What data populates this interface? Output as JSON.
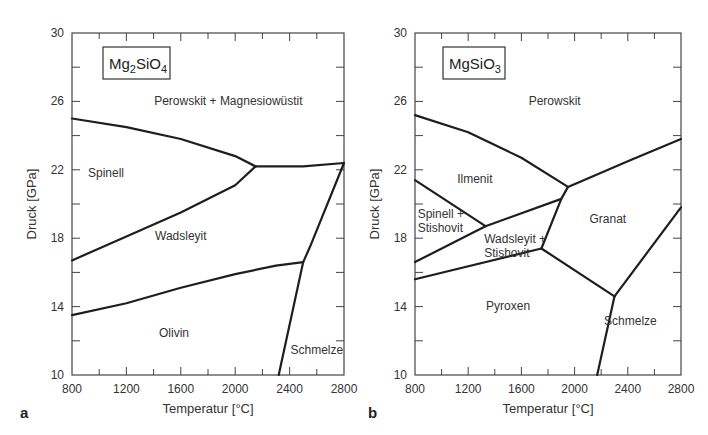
{
  "chart_data": [
    {
      "panel": "a",
      "type": "line",
      "title": "Mg2SiO4",
      "title_parts": {
        "base": "Mg",
        "sub1": "2",
        "mid": "SiO",
        "sub2": "4"
      },
      "xlabel": "Temperatur [°C]",
      "ylabel": "Druck [GPa]",
      "xlim": [
        800,
        2800
      ],
      "ylim": [
        10,
        30
      ],
      "xticks": [
        800,
        1200,
        1600,
        2000,
        2400,
        2800
      ],
      "yticks": [
        10,
        14,
        18,
        22,
        26,
        30
      ],
      "grid": false,
      "regions": [
        {
          "label": "Perowskit + Magnesiowüstit",
          "x": 1950,
          "y": 25.8
        },
        {
          "label": "Spinell",
          "x": 1050,
          "y": 21.6
        },
        {
          "label": "Wadsleyit",
          "x": 1600,
          "y": 17.9
        },
        {
          "label": "Olivin",
          "x": 1550,
          "y": 12.2
        },
        {
          "label": "Schmelze",
          "x": 2600,
          "y": 11.2
        }
      ],
      "series": [
        {
          "name": "Spinell–Perowskit+Mw",
          "x": [
            800,
            1200,
            1600,
            2000,
            2150
          ],
          "y": [
            25.0,
            24.5,
            23.8,
            22.8,
            22.2
          ]
        },
        {
          "name": "Spinell–Wadsleyit",
          "x": [
            800,
            1200,
            1600,
            2000,
            2150
          ],
          "y": [
            16.7,
            18.1,
            19.5,
            21.1,
            22.2
          ]
        },
        {
          "name": "Perowskit+Mw–Schmelze",
          "x": [
            2150,
            2500,
            2800
          ],
          "y": [
            22.2,
            22.2,
            22.4
          ]
        },
        {
          "name": "Wadsleyit–Olivin",
          "x": [
            800,
            1200,
            1600,
            2000,
            2300,
            2500
          ],
          "y": [
            13.5,
            14.2,
            15.1,
            15.9,
            16.4,
            16.6
          ]
        },
        {
          "name": "Solidus",
          "x": [
            2320,
            2500,
            2550,
            2800
          ],
          "y": [
            10.0,
            16.6,
            17.5,
            22.4
          ]
        }
      ]
    },
    {
      "panel": "b",
      "type": "line",
      "title": "MgSiO3",
      "title_parts": {
        "base": "MgSiO",
        "sub1": "3"
      },
      "xlabel": "Temperatur [°C]",
      "ylabel": "Druck [GPa]",
      "xlim": [
        800,
        2800
      ],
      "ylim": [
        10,
        30
      ],
      "xticks": [
        800,
        1200,
        1600,
        2000,
        2400,
        2800
      ],
      "yticks": [
        10,
        14,
        18,
        22,
        26,
        30
      ],
      "grid": false,
      "regions": [
        {
          "label": "Perowskit",
          "x": 1850,
          "y": 25.8
        },
        {
          "label": "Ilmenit",
          "x": 1250,
          "y": 21.2
        },
        {
          "label": [
            "Spinell +",
            "Stishovit"
          ],
          "x": 820,
          "y": 19.2
        },
        {
          "label": [
            "Wadsleyit +",
            "Stishovit"
          ],
          "x": 1320,
          "y": 17.7
        },
        {
          "label": "Granat",
          "x": 2250,
          "y": 18.9
        },
        {
          "label": "Pyroxen",
          "x": 1500,
          "y": 13.8
        },
        {
          "label": "Schmelze",
          "x": 2420,
          "y": 12.9
        }
      ],
      "series": [
        {
          "name": "Ilmenit–Perowskit",
          "x": [
            800,
            1200,
            1600,
            1950
          ],
          "y": [
            25.2,
            24.2,
            22.7,
            21.0
          ]
        },
        {
          "name": "Granat–Perowskit",
          "x": [
            1950,
            2400,
            2800
          ],
          "y": [
            21.0,
            22.5,
            23.8
          ]
        },
        {
          "name": "Ilmenit–Spinell+St",
          "x": [
            800,
            1330
          ],
          "y": [
            21.4,
            18.7
          ]
        },
        {
          "name": "Ilmenit–Wadsleyit+St",
          "x": [
            1330,
            1900,
            1950
          ],
          "y": [
            18.7,
            20.3,
            21.0
          ]
        },
        {
          "name": "Spinell+St–Wadsleyit+St",
          "x": [
            800,
            1330
          ],
          "y": [
            16.6,
            18.7
          ]
        },
        {
          "name": "Wadsleyit+St–Pyroxen",
          "x": [
            800,
            1750
          ],
          "y": [
            15.6,
            17.4
          ]
        },
        {
          "name": "Wadsleyit+St–Granat",
          "x": [
            1750,
            1900
          ],
          "y": [
            17.4,
            20.3
          ]
        },
        {
          "name": "Pyroxen–Granat",
          "x": [
            1750,
            2300
          ],
          "y": [
            17.4,
            14.6
          ]
        },
        {
          "name": "Granat–Schmelze",
          "x": [
            2300,
            2800
          ],
          "y": [
            14.6,
            19.8
          ]
        },
        {
          "name": "Pyroxen–Schmelze",
          "x": [
            2170,
            2300
          ],
          "y": [
            10.0,
            14.6
          ]
        }
      ]
    }
  ]
}
